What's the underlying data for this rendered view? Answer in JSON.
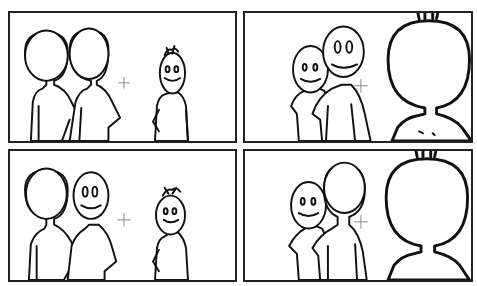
{
  "caption": "",
  "comic": {
    "layout": "2x2 grid of comic panels",
    "panels": [
      {
        "id": "panel-1",
        "description": "Two characters from behind (left) facing a smiling spiky-haired character (right), crosshair between them"
      },
      {
        "id": "panel-2",
        "description": "Two smiling characters facing viewer; large spiky-haired character seen from behind in foreground"
      },
      {
        "id": "panel-3",
        "description": "One character from behind, one smiling; spiky-haired character smiling on right, crosshair between"
      },
      {
        "id": "panel-4",
        "description": "One smiling character, one seen from behind; large spiky-haired character from behind in foreground"
      }
    ]
  }
}
